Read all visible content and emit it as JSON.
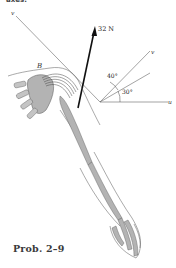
{
  "header": {
    "cut_text": "axes."
  },
  "figure": {
    "force_label": "32 N",
    "point_label": "B",
    "axis_left_label": "v",
    "axis_incline_label": "v",
    "axis_horizontal_label": "u",
    "angle_upper": "40°",
    "angle_lower": "30°",
    "colors": {
      "bone": "#b3b3b3",
      "line": "#555555",
      "arrow": "#111111"
    }
  },
  "caption": "Prob. 2–9"
}
